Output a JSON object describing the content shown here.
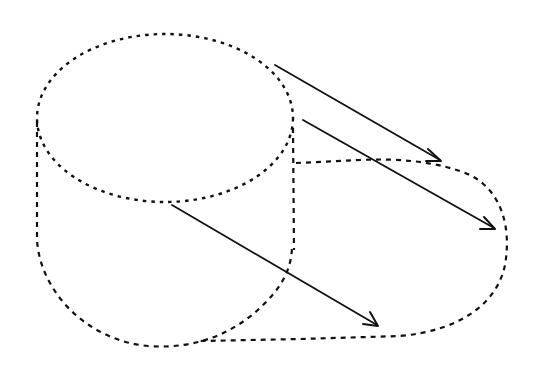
{
  "diagram": {
    "stroke_color": "#111111",
    "background_color": "#ffffff",
    "shapes": {
      "cylinder_top_ellipse": {
        "cx": 165,
        "cy": 118,
        "rx": 128,
        "ry": 84,
        "style": "dotted"
      },
      "cylinder_left_side": {
        "from": [
          37,
          122
        ],
        "to": [
          37,
          245
        ],
        "style": "dashed"
      },
      "cylinder_right_side": {
        "from": [
          294,
          130
        ],
        "to": [
          294,
          270
        ],
        "style": "dashed"
      },
      "cylinder_bottom_arc": {
        "style": "dashed"
      },
      "projected_shape_outline": {
        "style": "dashed"
      }
    },
    "arrows": [
      {
        "id": "arrow-top",
        "from": [
          275,
          65
        ],
        "to": [
          440,
          160
        ]
      },
      {
        "id": "arrow-middle",
        "from": [
          303,
          120
        ],
        "to": [
          495,
          228
        ]
      },
      {
        "id": "arrow-bottom",
        "from": [
          172,
          205
        ],
        "to": [
          378,
          325
        ]
      }
    ]
  }
}
